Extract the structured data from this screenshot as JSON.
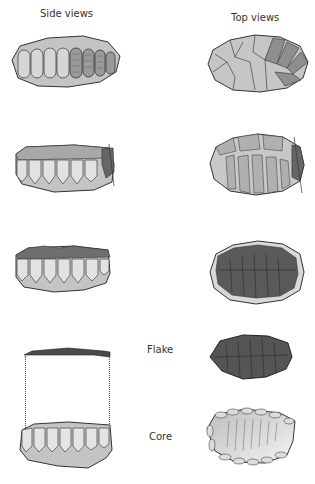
{
  "headers": {
    "side": "Side views",
    "top": "Top views"
  },
  "labels": {
    "flake": "Flake",
    "core": "Core"
  },
  "colors": {
    "light_flake": "#c9c9c9",
    "mid_flake": "#9a9a9a",
    "dark_flake": "#555555",
    "outline": "#333333",
    "background": "#ffffff"
  },
  "rows": [
    {
      "stage": 1,
      "side_view": "core-side-stage-1",
      "top_view": "core-top-stage-1"
    },
    {
      "stage": 2,
      "side_view": "core-side-stage-2",
      "top_view": "core-top-stage-2"
    },
    {
      "stage": 3,
      "side_view": "core-side-stage-3",
      "top_view": "core-top-stage-3"
    },
    {
      "stage": 4,
      "side_view": "flake-and-core-side",
      "top_view": "flake-top-and-core-top"
    }
  ]
}
